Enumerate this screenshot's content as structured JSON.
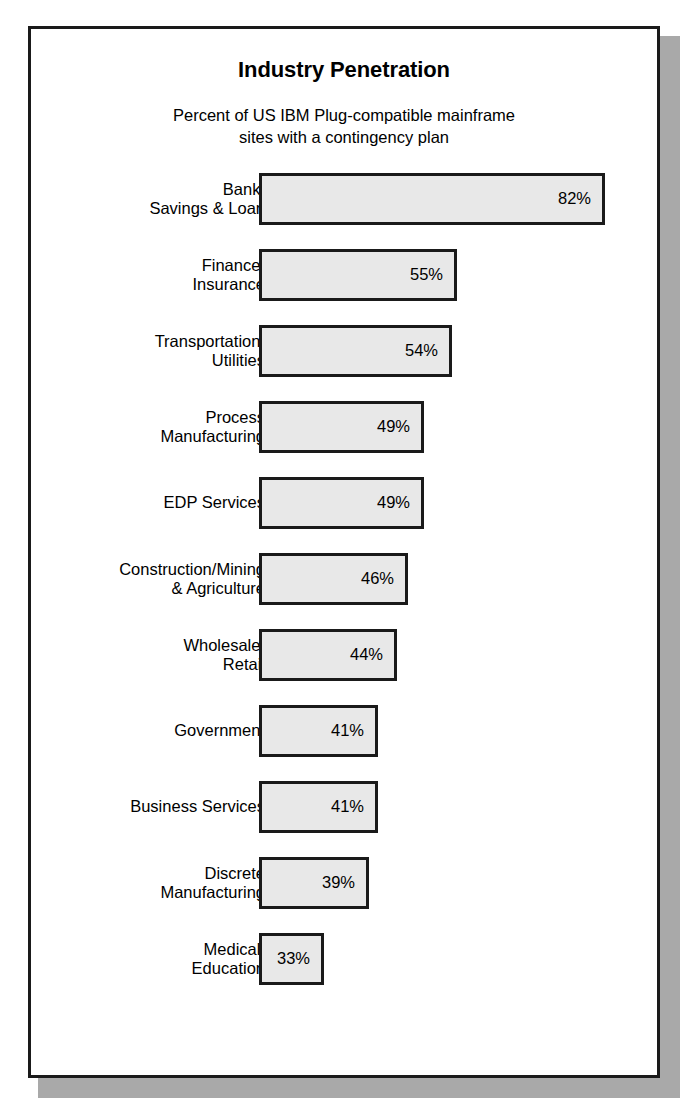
{
  "chart_data": {
    "type": "bar",
    "orientation": "horizontal",
    "title": "Industry Penetration",
    "subtitle_lines": [
      "Percent of US IBM Plug-compatible mainframe",
      "sites with a contingency plan"
    ],
    "xlabel": "",
    "ylabel": "",
    "value_unit": "%",
    "grid": false,
    "legend": null,
    "axis_visible": false,
    "categories": [
      "Bank/\nSavings & Loan",
      "Finance/\nInsurance",
      "Transportation/\nUtilities",
      "Process\nManufacturing",
      "EDP Services",
      "Construction/Mining\n& Agriculture",
      "Wholesale/\nRetail",
      "Government",
      "Business Services",
      "Discrete\nManufacturing",
      "Medical/\nEducation"
    ],
    "values": [
      82,
      55,
      54,
      49,
      49,
      46,
      44,
      41,
      41,
      39,
      33
    ],
    "value_labels": [
      "82%",
      "55%",
      "54%",
      "49%",
      "49%",
      "46%",
      "44%",
      "41%",
      "41%",
      "39%",
      "33%"
    ],
    "bar_pixel_widths": [
      346,
      198,
      193,
      165,
      165,
      149,
      138,
      119,
      119,
      110,
      65
    ],
    "colors": {
      "bar_fill": "#e8e8e8",
      "bar_border": "#1a1a1a",
      "text": "#000000",
      "frame_border": "#1a1a1a",
      "frame_shadow": "#a9a9a9",
      "background": "#ffffff"
    }
  }
}
